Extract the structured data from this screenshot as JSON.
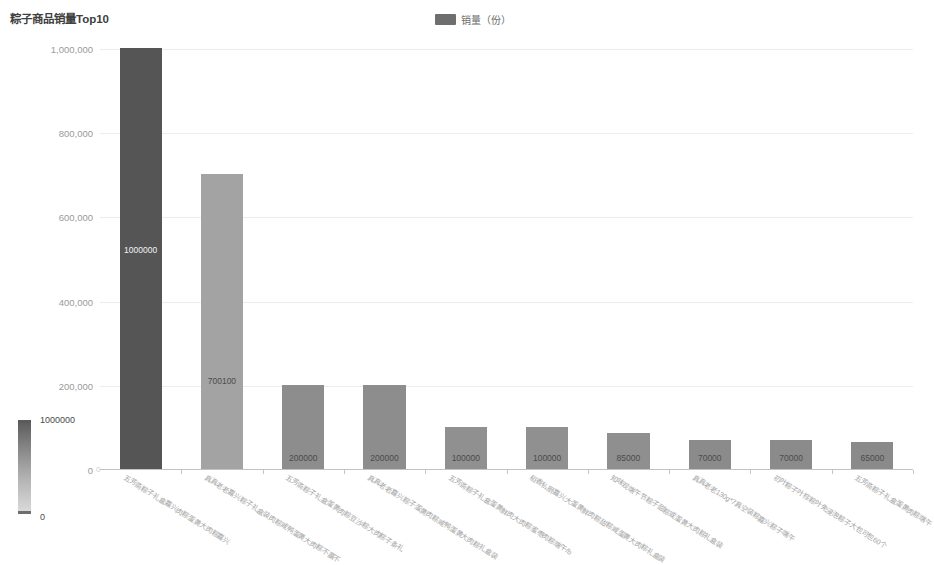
{
  "title": "粽子商品销量Top10",
  "legend": {
    "label": "销量（份）",
    "swatch_color": "#6e6e6e"
  },
  "visual_map": {
    "max_label": "1000000",
    "min_label": "0",
    "orientation": "vertical",
    "gradient_low": "#d9d9d9",
    "gradient_high": "#5e5e5e"
  },
  "axis": {
    "y_ticks": [
      "0",
      "200,000",
      "400,000",
      "600,000",
      "800,000",
      "1,000,000"
    ],
    "y_tick_values": [
      0,
      200000,
      400000,
      600000,
      800000,
      1000000
    ],
    "x_label_rotation": "32"
  },
  "chart_data": {
    "type": "bar",
    "title": "粽子商品销量Top10",
    "xlabel": "",
    "ylabel": "",
    "ylim": [
      0,
      1000000
    ],
    "grid": true,
    "legend_position": "top-center",
    "series_name": "销量（份）",
    "categories": [
      "五芳斋粽子礼盒嘉兴肉粽蛋黄大肉粽嘉兴",
      "真真老老嘉兴粽子礼盒装肉粽咸鸭蛋黄大肉粽不赢不",
      "五芳斋粽子礼盒蛋黄肉粽豆沙粽大肉粽子条礼",
      "真真老老嘉兴粽子蛋黄肉粽咸鸭蛋黄大肉粽礼盒装",
      "五芳斋粽子礼盒蛋黄鲜肉大肉粽蜜枣肉粽端午/b",
      "稻香私厨嘉兴大蛋黄鲜肉粽甜粽咸蛋黄大肉粽礼盒装",
      "知味观端午节粽子甜粽或蛋黄大肉粽礼盒装",
      "真真老老130g*7真空装粽嘉兴粽子端午",
      "初叶粽子叶棕粽叶免浸泡粽子大包可包60个",
      "五芳斋粽子礼盒蛋黄肉粽端午"
    ],
    "values": [
      1000000,
      700100,
      200000,
      200000,
      100000,
      100000,
      85000,
      70000,
      70000,
      65000
    ],
    "bar_labels": [
      "1000000",
      "700100",
      "200000",
      "200000",
      "100000",
      "100000",
      "85000",
      "70000",
      "70000",
      "65000"
    ],
    "bar_colors": [
      "#555555",
      "#a3a3a3",
      "#8d8d8d",
      "#8d8d8d",
      "#909090",
      "#909090",
      "#8f8f8f",
      "#8b8b8b",
      "#8b8b8b",
      "#8a8a8a"
    ]
  }
}
